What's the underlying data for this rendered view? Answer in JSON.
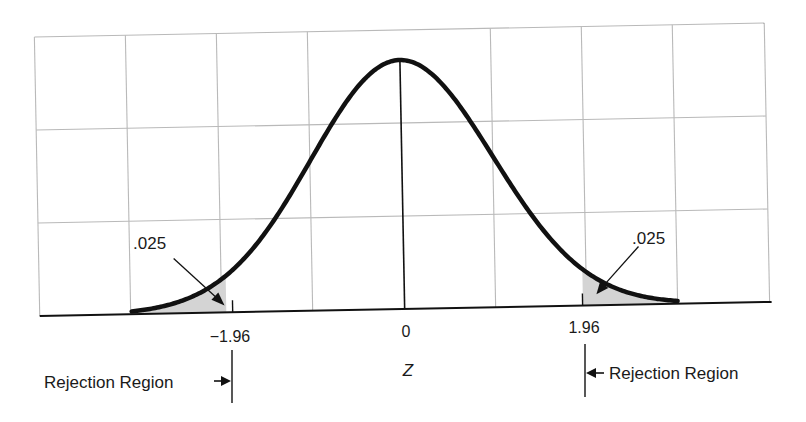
{
  "chart_data": {
    "type": "line",
    "title": "",
    "subtitle": "Standard normal distribution with two-tailed rejection regions",
    "xlabel": "Z",
    "ylabel": "",
    "x_range": [
      -4.0,
      4.0
    ],
    "grid": true,
    "legend": "none",
    "series": [
      {
        "name": "Standard normal density",
        "function": "exp(-z^2/2)/sqrt(2*pi)",
        "z_start": -3.0,
        "z_end": 3.0
      }
    ],
    "x_ticks": [
      {
        "value": -1.96,
        "label": "−1.96"
      },
      {
        "value": 0,
        "label": "0"
      },
      {
        "value": 1.96,
        "label": "1.96"
      }
    ],
    "shaded_regions": [
      {
        "from": -3.0,
        "to": -1.96,
        "area": 0.025,
        "label": ".025"
      },
      {
        "from": 1.96,
        "to": 3.0,
        "area": 0.025,
        "label": ".025"
      }
    ],
    "annotations": [
      {
        "text": ".025",
        "target": "left tail area"
      },
      {
        "text": ".025",
        "target": "right tail area"
      },
      {
        "text": "Rejection Region",
        "target": "z < -1.96",
        "arrow": "right"
      },
      {
        "text": "Rejection Region",
        "target": "z > 1.96",
        "arrow": "left"
      }
    ]
  },
  "labels": {
    "tick_neg": "−1.96",
    "tick_zero": "0",
    "tick_pos": "1.96",
    "axis_label": "Z",
    "tail_left": ".025",
    "tail_right": ".025",
    "rejection_left": "Rejection Region",
    "rejection_right": "Rejection Region"
  },
  "colors": {
    "curve": "#111111",
    "grid": "#b9b9b9",
    "shade": "#d4d4d4",
    "text": "#1a1a1a"
  }
}
